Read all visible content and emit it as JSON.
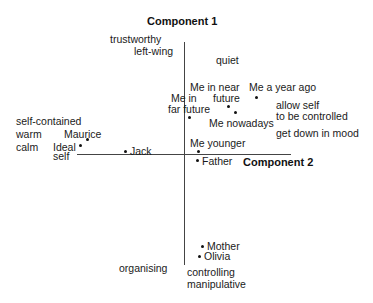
{
  "diagram": {
    "type": "biplot",
    "axes": {
      "vertical": {
        "title": "Component 1",
        "positive_pole": [
          "trustworthy",
          "left-wing"
        ],
        "negative_pole": [
          "controlling",
          "manipulative"
        ]
      },
      "horizontal": {
        "title": "Component 2",
        "negative_pole": [
          "self-contained",
          "warm",
          "calm",
          "self"
        ],
        "positive_pole": [
          "allow self",
          "to be controlled",
          "get down in mood"
        ]
      }
    },
    "construct_labels": {
      "trustworthy": "trustworthy",
      "left_wing": "left-wing",
      "quiet": "quiet",
      "self_contained": "self-contained",
      "warm": "warm",
      "calm": "calm",
      "self": "self",
      "allow_self": "allow self",
      "to_be_controlled": "to be controlled",
      "get_down_in_mood": "get down in mood",
      "organising": "organising",
      "controlling": "controlling",
      "manipulative": "manipulative"
    },
    "elements": {
      "maurice": "Maurice",
      "ideal": "Ideal",
      "jack": "Jack",
      "me_in_far_future_1": "Me in",
      "me_in_far_future_2": "far future",
      "me_in_near_future_1": "Me in near",
      "me_in_near_future_2": "future",
      "me_a_year_ago": "Me a year ago",
      "me_nowadays": "Me nowadays",
      "me_younger": "Me younger",
      "father": "Father",
      "mother": "Mother",
      "olivia": "Olivia"
    }
  }
}
